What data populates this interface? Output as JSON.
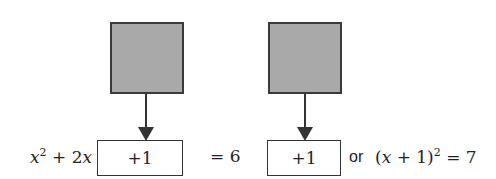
{
  "left_expr": {
    "var": "x",
    "sup": "2",
    "rest": " + 2",
    "var2": "x"
  },
  "left_box": "+1",
  "middle_eq": "= 6",
  "right_box": "+1",
  "or_label": "or",
  "right_expr": {
    "open": "(",
    "var": "x",
    "mid": " + 1)",
    "sup": "2",
    "end": " = 7"
  }
}
